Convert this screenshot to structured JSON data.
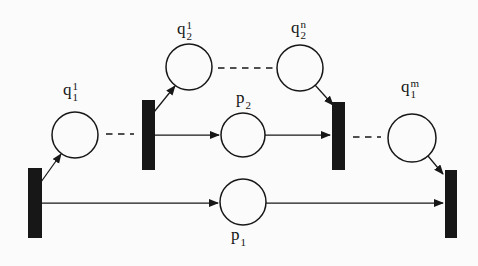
{
  "figure": {
    "background": "#fbfbfb",
    "ink": "#171717",
    "place_fill": "#fbfbfb"
  },
  "labels": [
    {
      "id": "q1-1",
      "base": "q",
      "sup": "1",
      "sub": "1"
    },
    {
      "id": "q2-1",
      "base": "q",
      "sup": "1",
      "sub": "2"
    },
    {
      "id": "q2-n",
      "base": "q",
      "sup": "n",
      "sub": "2"
    },
    {
      "id": "p2",
      "base": "p",
      "sup": "",
      "sub": "2"
    },
    {
      "id": "q1-m",
      "base": "q",
      "sup": "m",
      "sub": "1"
    },
    {
      "id": "p1",
      "base": "p",
      "sup": "",
      "sub": "1"
    }
  ],
  "diagram": {
    "places": [
      {
        "id": "q1-1",
        "cx": 75,
        "cy": 135,
        "r": 23
      },
      {
        "id": "q2-1",
        "cx": 189,
        "cy": 67,
        "r": 23
      },
      {
        "id": "q2-n",
        "cx": 300,
        "cy": 68,
        "r": 23
      },
      {
        "id": "p2",
        "cx": 243,
        "cy": 135,
        "r": 22
      },
      {
        "id": "q1-m",
        "cx": 412,
        "cy": 138,
        "r": 24
      },
      {
        "id": "p1",
        "cx": 243,
        "cy": 202,
        "r": 23
      }
    ],
    "transitions": [
      {
        "id": "t-bottom-left",
        "x": 28,
        "y": 168,
        "w": 14,
        "h": 70
      },
      {
        "id": "t-mid-left",
        "x": 142,
        "y": 100,
        "w": 13,
        "h": 70
      },
      {
        "id": "t-mid-right",
        "x": 332,
        "y": 102,
        "w": 13,
        "h": 68
      },
      {
        "id": "t-bottom-right",
        "x": 445,
        "y": 170,
        "w": 12,
        "h": 68
      }
    ],
    "arcs": [
      {
        "id": "t-bottom-left-to-q1-1",
        "x1": 41,
        "y1": 182,
        "x2": 61,
        "y2": 154,
        "style": "arrow"
      },
      {
        "id": "t-mid-left-to-q2-1",
        "x1": 154,
        "y1": 112,
        "x2": 175,
        "y2": 86,
        "style": "arrow"
      },
      {
        "id": "q2-n-to-t-mid-right",
        "x1": 315,
        "y1": 85,
        "x2": 333,
        "y2": 105,
        "style": "arrow"
      },
      {
        "id": "t-mid-left-to-p2",
        "x1": 155,
        "y1": 135,
        "x2": 219,
        "y2": 135,
        "style": "arrow"
      },
      {
        "id": "p2-to-t-mid-right",
        "x1": 265,
        "y1": 135,
        "x2": 330,
        "y2": 135,
        "style": "arrow"
      },
      {
        "id": "q1-m-to-t-bottom-right",
        "x1": 428,
        "y1": 156,
        "x2": 443,
        "y2": 174,
        "style": "arrow"
      },
      {
        "id": "t-bottom-left-to-p1",
        "x1": 42,
        "y1": 203,
        "x2": 218,
        "y2": 203,
        "style": "arrow"
      },
      {
        "id": "p1-to-t-bottom-right",
        "x1": 266,
        "y1": 203,
        "x2": 443,
        "y2": 203,
        "style": "arrow"
      },
      {
        "id": "ellipsis-q1-1-to-t-mid-left",
        "x1": 106,
        "y1": 134,
        "x2": 134,
        "y2": 134,
        "style": "dashed"
      },
      {
        "id": "ellipsis-q2-1-to-q2-n",
        "x1": 218,
        "y1": 68,
        "x2": 273,
        "y2": 68,
        "style": "dashed"
      },
      {
        "id": "ellipsis-t-mid-right-to-q1-m",
        "x1": 353,
        "y1": 137,
        "x2": 381,
        "y2": 137,
        "style": "dashed"
      }
    ]
  }
}
